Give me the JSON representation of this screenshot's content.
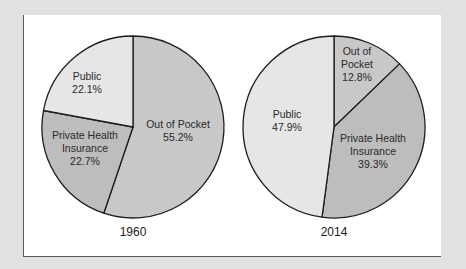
{
  "chart_data": [
    {
      "type": "pie",
      "title": "1960",
      "start_angle_deg": 0,
      "direction": "clockwise",
      "slices": [
        {
          "label": "Out of Pocket",
          "value": 55.2,
          "color": "#c8c8c8",
          "label_lines": [
            "Out of Pocket",
            "55.2%"
          ]
        },
        {
          "label": "Private Health Insurance",
          "value": 22.7,
          "color": "#bdbdbd",
          "label_lines": [
            "Private Health",
            "Insurance",
            "22.7%"
          ]
        },
        {
          "label": "Public",
          "value": 22.1,
          "color": "#e6e6e6",
          "label_lines": [
            "Public",
            "22.1%"
          ]
        }
      ]
    },
    {
      "type": "pie",
      "title": "2014",
      "start_angle_deg": 0,
      "direction": "clockwise",
      "slices": [
        {
          "label": "Out of Pocket",
          "value": 12.8,
          "color": "#c8c8c8",
          "label_lines": [
            "Out of",
            "Pocket",
            "12.8%"
          ]
        },
        {
          "label": "Private Health Insurance",
          "value": 39.3,
          "color": "#bdbdbd",
          "label_lines": [
            "Private Health",
            "Insurance",
            "39.3%"
          ]
        },
        {
          "label": "Public",
          "value": 47.9,
          "color": "#e6e6e6",
          "label_lines": [
            "Public",
            "47.9%"
          ]
        }
      ]
    }
  ],
  "pies": {
    "p1960": {
      "year": "1960",
      "out_of_pocket": {
        "line1": "Out of Pocket",
        "pct": "55.2%"
      },
      "private": {
        "line1": "Private Health",
        "line2": "Insurance",
        "pct": "22.7%"
      },
      "public": {
        "line1": "Public",
        "pct": "22.1%"
      }
    },
    "p2014": {
      "year": "2014",
      "out_of_pocket": {
        "line1": "Out of",
        "line2": "Pocket",
        "pct": "12.8%"
      },
      "private": {
        "line1": "Private Health",
        "line2": "Insurance",
        "pct": "39.3%"
      },
      "public": {
        "line1": "Public",
        "pct": "47.9%"
      }
    }
  },
  "colors": {
    "page_bg": "#e2e2e0",
    "panel_bg": "#ffffff",
    "out_of_pocket": "#c8c8c8",
    "private": "#bdbdbd",
    "public": "#e6e6e6",
    "outline": "#1e1e1e"
  }
}
